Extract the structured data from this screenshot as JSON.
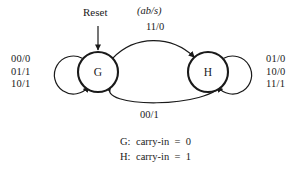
{
  "diagram": {
    "type": "finite-state-machine",
    "title_notation": "(ab/s)",
    "reset_label": "Reset",
    "states": [
      {
        "id": "G",
        "label": "G",
        "cx": 98,
        "cy": 72,
        "r": 20
      },
      {
        "id": "H",
        "label": "H",
        "cx": 208,
        "cy": 72,
        "r": 20
      }
    ],
    "self_loops": [
      {
        "state": "G",
        "side": "left",
        "conditions": [
          "00/0",
          "01/1",
          "10/1"
        ]
      },
      {
        "state": "H",
        "side": "right",
        "conditions": [
          "01/0",
          "10/0",
          "11/1"
        ]
      }
    ],
    "transitions": [
      {
        "from": "G",
        "to": "H",
        "label": "11/0",
        "position": "top"
      },
      {
        "from": "H",
        "to": "G",
        "label": "00/1",
        "position": "bottom"
      }
    ],
    "legend": [
      {
        "key": "G:",
        "text": "carry-in  =  0"
      },
      {
        "key": "H:",
        "text": "carry-in  =  1"
      }
    ],
    "colors": {
      "stroke": "#1a1a1a",
      "background": "#ffffff",
      "text": "#1a1a1a"
    }
  }
}
